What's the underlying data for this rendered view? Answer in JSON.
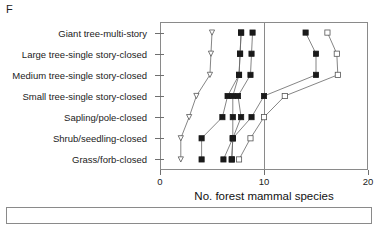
{
  "panel": {
    "label": "F"
  },
  "chart_data": {
    "type": "line",
    "title": "",
    "xlabel": "No. forest mammal species",
    "ylabel": "",
    "xlim": [
      0,
      20
    ],
    "xticks": [
      0,
      10,
      20
    ],
    "xticklabels": [
      "0",
      "10",
      "20"
    ],
    "grid": false,
    "legend": "none",
    "orientation": "horizontal",
    "reference_line_x": 10,
    "categories": [
      "Giant tree-multi-story",
      "Large  tree-single story-closed",
      "Medium  tree-single story-closed",
      "Small tree-single story-closed",
      "Sapling/pole-closed",
      "Shrub/seedling-closed",
      "Grass/forb-closed"
    ],
    "series": [
      {
        "name": "series-1",
        "marker": "open-triangle-down",
        "values": [
          5.0,
          4.9,
          4.8,
          3.5,
          2.8,
          2.0,
          2.0
        ]
      },
      {
        "name": "series-2",
        "marker": "filled-triangle-down",
        "values": [
          7.8,
          7.7,
          7.6,
          6.5,
          6.0,
          4.0,
          4.0
        ]
      },
      {
        "name": "series-3",
        "marker": "filled-square-inner",
        "values": [
          7.8,
          7.7,
          7.6,
          7.0,
          7.0,
          7.0,
          6.1
        ]
      },
      {
        "name": "series-4",
        "marker": "filled-square",
        "values": [
          8.9,
          8.8,
          8.7,
          7.5,
          7.8,
          7.0,
          6.9
        ]
      },
      {
        "name": "series-5",
        "marker": "filled-square-upper",
        "values": [
          14.0,
          15.0,
          15.0,
          10.0,
          8.8,
          7.0,
          6.9
        ]
      },
      {
        "name": "series-6",
        "marker": "open-square",
        "values": [
          16.1,
          17.0,
          17.1,
          12.0,
          10.0,
          8.7,
          7.6
        ]
      }
    ]
  }
}
